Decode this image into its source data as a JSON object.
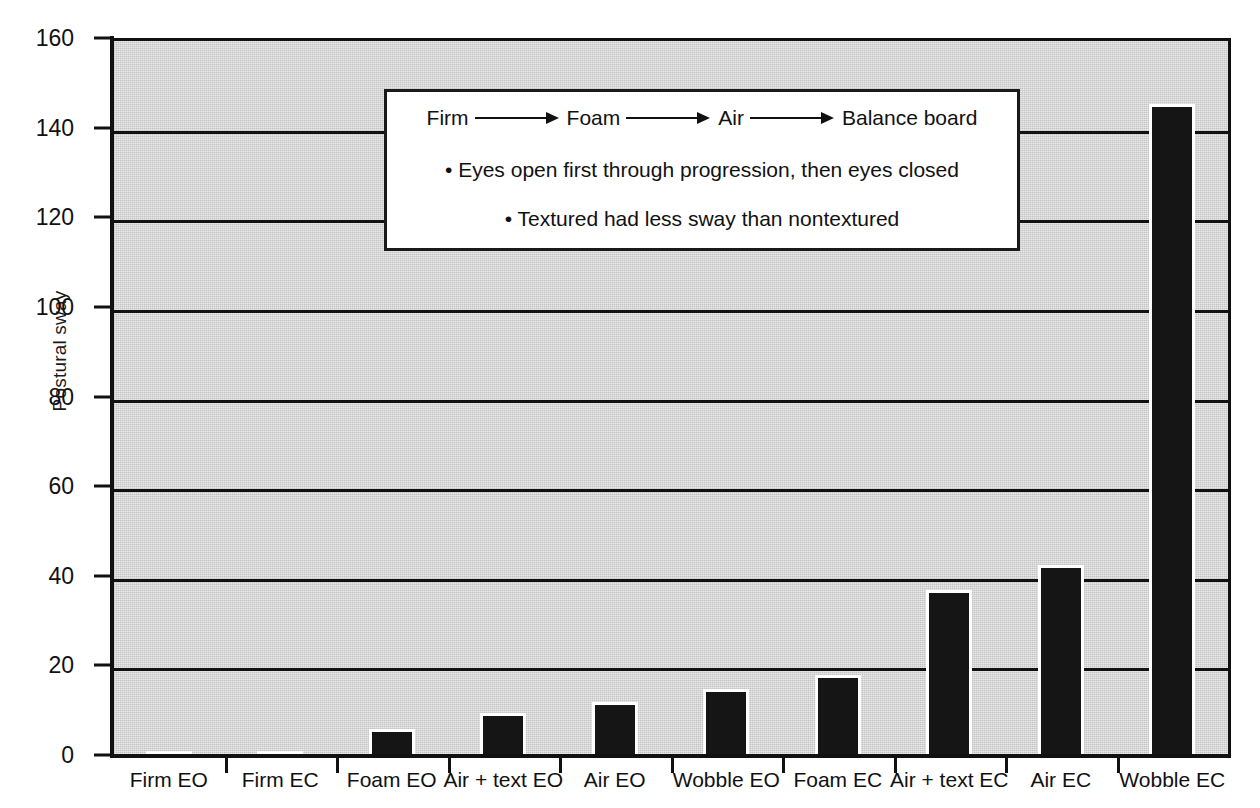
{
  "chart_data": {
    "type": "bar",
    "title": "",
    "xlabel": "",
    "ylabel": "Postural sway",
    "ylim": [
      0,
      160
    ],
    "yticks": [
      0,
      20,
      40,
      60,
      80,
      100,
      120,
      140,
      160
    ],
    "grid": true,
    "legend": "none",
    "categories": [
      "Firm EO",
      "Firm EC",
      "Foam EO",
      "Air + text EO",
      "Air EO",
      "Wobble EO",
      "Foam EC",
      "Air + text EC",
      "Air EC",
      "Wobble EC"
    ],
    "values": [
      1.5,
      1.5,
      6.5,
      10,
      12.5,
      15.5,
      18.5,
      37.5,
      43,
      146
    ],
    "bar_color": "#151515",
    "plot_background": "#d2d2d2",
    "annotations": {
      "progression": [
        "Firm",
        "Foam",
        "Air",
        "Balance board"
      ],
      "bullets": [
        "• Eyes open first through progression, then eyes closed",
        "• Textured had less sway than nontextured"
      ]
    }
  },
  "axis": {
    "y_title": "Postural sway"
  }
}
